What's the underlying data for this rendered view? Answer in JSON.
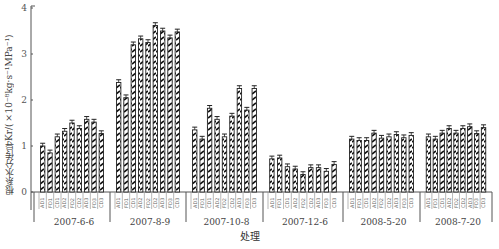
{
  "chart_data": {
    "type": "bar",
    "title": "",
    "xlabel": "处理",
    "ylabel": "根系水分传导Kr/(×10⁻⁸kg·s⁻¹MPa⁻¹)",
    "ylim": [
      0,
      4
    ],
    "yticks": [
      0,
      1,
      2,
      3,
      4
    ],
    "grid": false,
    "legend": null,
    "bar_labels": [
      "AD1",
      "FD1",
      "CD1",
      "AD2",
      "FD2",
      "CD2",
      "AD3",
      "FD3",
      "CD3"
    ],
    "categories": [
      "2007-6-6",
      "2007-8-9",
      "2007-10-8",
      "2007-12-6",
      "2008-5-20",
      "2008-7-20"
    ],
    "groups": [
      {
        "name": "2007-6-6",
        "values": [
          1.0,
          0.85,
          1.2,
          1.32,
          1.5,
          1.38,
          1.58,
          1.52,
          1.27
        ]
      },
      {
        "name": "2007-8-9",
        "values": [
          2.38,
          2.05,
          3.2,
          3.33,
          3.25,
          3.62,
          3.5,
          3.35,
          3.48
        ]
      },
      {
        "name": "2007-10-8",
        "values": [
          1.35,
          1.15,
          1.82,
          1.58,
          1.2,
          1.65,
          2.25,
          1.78,
          2.25
        ]
      },
      {
        "name": "2007-12-6",
        "values": [
          0.72,
          0.74,
          0.55,
          0.5,
          0.38,
          0.53,
          0.53,
          0.45,
          0.6
        ]
      },
      {
        "name": "2008-5-20",
        "values": [
          1.15,
          1.12,
          1.12,
          1.28,
          1.17,
          1.2,
          1.25,
          1.18,
          1.23
        ]
      },
      {
        "name": "2008-7-20",
        "values": [
          1.2,
          1.15,
          1.28,
          1.38,
          1.28,
          1.38,
          1.42,
          1.27,
          1.4
        ]
      }
    ],
    "error_bar_approx": 0.06
  },
  "colors": {
    "bar_fill": "#ffffff",
    "bar_stroke": "#222222",
    "hatch": "#111111",
    "axis": "#444444"
  }
}
